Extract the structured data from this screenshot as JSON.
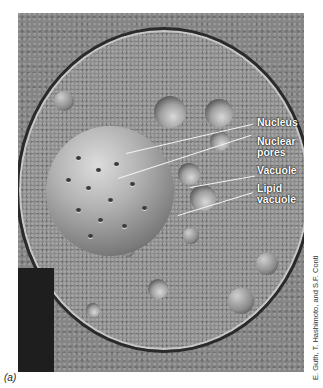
{
  "figure": {
    "panel_label": "(a)",
    "credit": "E. Guth, T. Hashimoto, and S.F. Conti",
    "image_description": "Freeze-fracture electron micrograph of a yeast cell showing nucleus with nuclear pores and vacuoles",
    "labels": [
      {
        "id": "nucleus",
        "text": "Nucleus"
      },
      {
        "id": "nuclear-pores",
        "text": "Nuclear\npores",
        "lines": [
          "Nuclear",
          "pores"
        ]
      },
      {
        "id": "vacuole",
        "text": "Vacuole"
      },
      {
        "id": "lipid-vacuole",
        "text": "Lipid\nvacuole",
        "lines": [
          "Lipid",
          "vacuole"
        ]
      }
    ]
  }
}
